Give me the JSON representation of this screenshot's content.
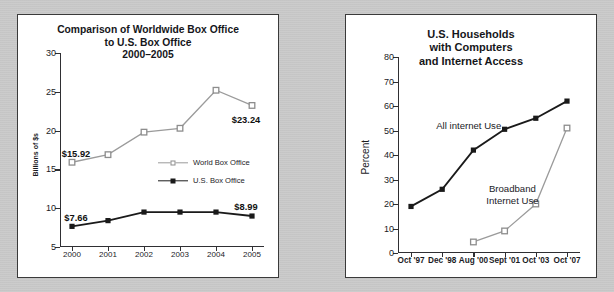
{
  "colors": {
    "background": "#c9c9c9",
    "panel": "#ffffff",
    "panel_border": "#3a3a3a",
    "dark_series": "#1a1a1a",
    "light_series": "#9b9b9b",
    "axis": "#2f2f33",
    "text": "#15161a"
  },
  "chart_data": [
    {
      "id": "box-office",
      "type": "line",
      "title": "Comparison of Worldwide Box Office to U.S. Box Office 2000–2005",
      "title_lines": [
        "Comparison of Worldwide Box Office",
        "to U.S. Box Office",
        "2000–2005"
      ],
      "xlabel": "",
      "ylabel": "Billions of $s",
      "categories": [
        "2000",
        "2001",
        "2002",
        "2003",
        "2004",
        "2005"
      ],
      "ylim": [
        5,
        30
      ],
      "yticks": [
        5,
        10,
        15,
        20,
        25,
        30
      ],
      "ytick_labels": [
        "5",
        "10",
        "15",
        "20",
        "25",
        "30"
      ],
      "grid": false,
      "legend_position": "inside-right",
      "series": [
        {
          "name": "World Box Office",
          "marker": "open-square",
          "color": "#9b9b9b",
          "values": [
            15.92,
            16.9,
            19.8,
            20.3,
            25.2,
            23.24
          ]
        },
        {
          "name": "U.S. Box Office",
          "marker": "filled-square",
          "color": "#1a1a1a",
          "values": [
            7.66,
            8.4,
            9.5,
            9.5,
            9.5,
            8.99
          ]
        }
      ],
      "annotations": [
        {
          "text": "$15.92",
          "series": "World Box Office",
          "category": "2000"
        },
        {
          "text": "$23.24",
          "series": "World Box Office",
          "category": "2005"
        },
        {
          "text": "$7.66",
          "series": "U.S. Box Office",
          "category": "2000"
        },
        {
          "text": "$8.99",
          "series": "U.S. Box Office",
          "category": "2005"
        }
      ]
    },
    {
      "id": "household-internet",
      "type": "line",
      "title": "U.S. Households with Computers and Internet Access",
      "title_lines": [
        "U.S. Households",
        "with Computers",
        "and Internet Access"
      ],
      "xlabel": "",
      "ylabel": "Percent",
      "categories": [
        "Oct '97",
        "Dec '98",
        "Aug '00",
        "Sept '01",
        "Oct '03",
        "Oct '07"
      ],
      "ylim": [
        0,
        80
      ],
      "yticks": [
        0,
        10,
        20,
        30,
        40,
        50,
        60,
        70,
        80
      ],
      "ytick_labels": [
        "0",
        "10",
        "20",
        "30",
        "40",
        "50",
        "60",
        "70",
        "80"
      ],
      "grid": false,
      "legend_position": "inline-annotations",
      "series": [
        {
          "name": "All internet Use",
          "marker": "filled-square",
          "color": "#1a1a1a",
          "values": [
            19,
            26,
            42,
            50.5,
            55,
            62
          ]
        },
        {
          "name": "Broadband Internet Use",
          "marker": "open-square",
          "color": "#9b9b9b",
          "values": [
            null,
            null,
            4.5,
            9,
            20,
            51
          ]
        }
      ],
      "annotations": [
        {
          "text": "All internet Use",
          "lines": [
            "All internet Use"
          ],
          "series": "All internet Use"
        },
        {
          "text": "Broadband Internet Use",
          "lines": [
            "Broadband",
            "Internet Use"
          ],
          "series": "Broadband Internet Use"
        }
      ]
    }
  ]
}
